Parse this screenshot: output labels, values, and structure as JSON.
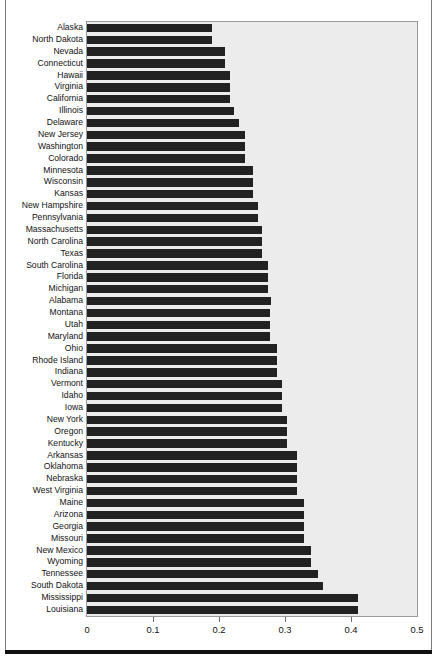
{
  "chart_data": {
    "type": "bar",
    "orientation": "horizontal",
    "title": "",
    "subtitle": "",
    "xlabel": "",
    "ylabel": "",
    "xlim": [
      0,
      0.5
    ],
    "xticks": [
      "0",
      "0.1",
      "0.2",
      "0.3",
      "0.4",
      "0.5"
    ],
    "xtick_values": [
      0,
      0.1,
      0.2,
      0.3,
      0.4,
      0.5
    ],
    "grid": false,
    "legend": null,
    "bar_color": "#222222",
    "panel_color": "#ececec",
    "categories": [
      "Alaska",
      "North Dakota",
      "Nevada",
      "Connecticut",
      "Hawaii",
      "Virginia",
      "California",
      "Illinois",
      "Delaware",
      "New Jersey",
      "Washington",
      "Colorado",
      "Minnesota",
      "Wisconsin",
      "Kansas",
      "New Hampshire",
      "Pennsylvania",
      "Massachusetts",
      "North Carolina",
      "Texas",
      "South Carolina",
      "Florida",
      "Michigan",
      "Alabama",
      "Montana",
      "Utah",
      "Maryland",
      "Ohio",
      "Rhode Island",
      "Indiana",
      "Vermont",
      "Idaho",
      "Iowa",
      "New York",
      "Oregon",
      "Kentucky",
      "Arkansas",
      "Oklahoma",
      "Nebraska",
      "West Virginia",
      "Maine",
      "Arizona",
      "Georgia",
      "Missouri",
      "New Mexico",
      "Wyoming",
      "Tennessee",
      "South Dakota",
      "Mississippi",
      "Louisiana"
    ],
    "values": [
      0.19,
      0.19,
      0.209,
      0.209,
      0.217,
      0.217,
      0.217,
      0.222,
      0.231,
      0.239,
      0.239,
      0.239,
      0.251,
      0.251,
      0.251,
      0.259,
      0.259,
      0.265,
      0.265,
      0.265,
      0.274,
      0.274,
      0.274,
      0.279,
      0.277,
      0.277,
      0.277,
      0.288,
      0.288,
      0.288,
      0.296,
      0.296,
      0.296,
      0.303,
      0.303,
      0.303,
      0.318,
      0.318,
      0.318,
      0.318,
      0.329,
      0.329,
      0.329,
      0.329,
      0.34,
      0.34,
      0.35,
      0.358,
      0.41,
      0.41
    ],
    "bars": [
      {
        "label": "Alaska",
        "value": 0.19
      },
      {
        "label": "North Dakota",
        "value": 0.19
      },
      {
        "label": "Nevada",
        "value": 0.209
      },
      {
        "label": "Connecticut",
        "value": 0.209
      },
      {
        "label": "Hawaii",
        "value": 0.217
      },
      {
        "label": "Virginia",
        "value": 0.217
      },
      {
        "label": "California",
        "value": 0.217
      },
      {
        "label": "Illinois",
        "value": 0.222
      },
      {
        "label": "Delaware",
        "value": 0.231
      },
      {
        "label": "New Jersey",
        "value": 0.239
      },
      {
        "label": "Washington",
        "value": 0.239
      },
      {
        "label": "Colorado",
        "value": 0.239
      },
      {
        "label": "Minnesota",
        "value": 0.251
      },
      {
        "label": "Wisconsin",
        "value": 0.251
      },
      {
        "label": "Kansas",
        "value": 0.251
      },
      {
        "label": "New Hampshire",
        "value": 0.259
      },
      {
        "label": "Pennsylvania",
        "value": 0.259
      },
      {
        "label": "Massachusetts",
        "value": 0.265
      },
      {
        "label": "North Carolina",
        "value": 0.265
      },
      {
        "label": "Texas",
        "value": 0.265
      },
      {
        "label": "South Carolina",
        "value": 0.274
      },
      {
        "label": "Florida",
        "value": 0.274
      },
      {
        "label": "Michigan",
        "value": 0.274
      },
      {
        "label": "Alabama",
        "value": 0.279
      },
      {
        "label": "Montana",
        "value": 0.277
      },
      {
        "label": "Utah",
        "value": 0.277
      },
      {
        "label": "Maryland",
        "value": 0.277
      },
      {
        "label": "Ohio",
        "value": 0.288
      },
      {
        "label": "Rhode Island",
        "value": 0.288
      },
      {
        "label": "Indiana",
        "value": 0.288
      },
      {
        "label": "Vermont",
        "value": 0.296
      },
      {
        "label": "Idaho",
        "value": 0.296
      },
      {
        "label": "Iowa",
        "value": 0.296
      },
      {
        "label": "New York",
        "value": 0.303
      },
      {
        "label": "Oregon",
        "value": 0.303
      },
      {
        "label": "Kentucky",
        "value": 0.303
      },
      {
        "label": "Arkansas",
        "value": 0.318
      },
      {
        "label": "Oklahoma",
        "value": 0.318
      },
      {
        "label": "Nebraska",
        "value": 0.318
      },
      {
        "label": "West Virginia",
        "value": 0.318
      },
      {
        "label": "Maine",
        "value": 0.329
      },
      {
        "label": "Arizona",
        "value": 0.329
      },
      {
        "label": "Georgia",
        "value": 0.329
      },
      {
        "label": "Missouri",
        "value": 0.329
      },
      {
        "label": "New Mexico",
        "value": 0.34
      },
      {
        "label": "Wyoming",
        "value": 0.34
      },
      {
        "label": "Tennessee",
        "value": 0.35
      },
      {
        "label": "South Dakota",
        "value": 0.358
      },
      {
        "label": "Mississippi",
        "value": 0.41
      },
      {
        "label": "Louisiana",
        "value": 0.41
      }
    ]
  }
}
